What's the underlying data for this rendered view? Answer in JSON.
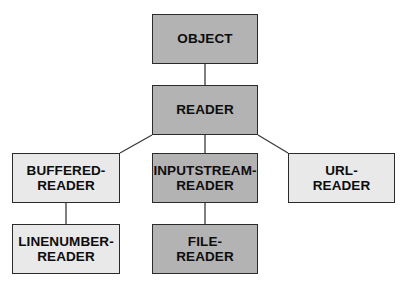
{
  "diagram": {
    "type": "class-hierarchy-tree",
    "background_color": "#ffffff",
    "palette": {
      "dark_fill": "#b3b3b3",
      "light_fill": "#e9e9e9",
      "border": "#2b2b2b",
      "text": "#0d0d0d",
      "connector": "#3a3a3a"
    },
    "nodes": [
      {
        "id": "object",
        "label": "OBJECT",
        "fill": "dark",
        "x": 152,
        "y": 14,
        "w": 106,
        "h": 50,
        "level": 0
      },
      {
        "id": "reader",
        "label": "READER",
        "fill": "dark",
        "x": 152,
        "y": 85,
        "w": 106,
        "h": 50,
        "level": 1
      },
      {
        "id": "buffered-reader",
        "label": "BUFFERED-\nREADER",
        "fill": "light",
        "x": 12,
        "y": 153,
        "w": 108,
        "h": 50,
        "level": 2
      },
      {
        "id": "inputstream-reader",
        "label": "INPUTSTREAM-\nREADER",
        "fill": "dark",
        "x": 152,
        "y": 153,
        "w": 106,
        "h": 50,
        "level": 2
      },
      {
        "id": "url-reader",
        "label": "URL-\nREADER",
        "fill": "light",
        "x": 288,
        "y": 153,
        "w": 107,
        "h": 50,
        "level": 2
      },
      {
        "id": "linenumber-reader",
        "label": "LINENUMBER-\nREADER",
        "fill": "light",
        "x": 12,
        "y": 224,
        "w": 108,
        "h": 50,
        "level": 3
      },
      {
        "id": "file-reader",
        "label": "FILE-\nREADER",
        "fill": "dark",
        "x": 152,
        "y": 224,
        "w": 106,
        "h": 50,
        "level": 3
      }
    ],
    "edges": [
      {
        "id": "object-reader",
        "from": "object",
        "to": "reader",
        "x1": 205,
        "y1": 64,
        "x2": 205,
        "y2": 85
      },
      {
        "id": "reader-buffered",
        "from": "reader",
        "to": "buffered-reader",
        "x1": 152,
        "y1": 135,
        "x2": 120,
        "y2": 153
      },
      {
        "id": "reader-inputstream",
        "from": "reader",
        "to": "inputstream-reader",
        "x1": 205,
        "y1": 135,
        "x2": 205,
        "y2": 153
      },
      {
        "id": "reader-url",
        "from": "reader",
        "to": "url-reader",
        "x1": 258,
        "y1": 135,
        "x2": 288,
        "y2": 153
      },
      {
        "id": "buffered-linenumber",
        "from": "buffered-reader",
        "to": "linenumber-reader",
        "x1": 66,
        "y1": 203,
        "x2": 66,
        "y2": 224
      },
      {
        "id": "inputstream-file",
        "from": "inputstream-reader",
        "to": "file-reader",
        "x1": 205,
        "y1": 203,
        "x2": 205,
        "y2": 224
      }
    ]
  }
}
